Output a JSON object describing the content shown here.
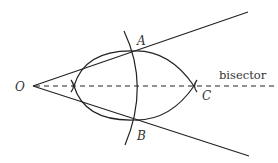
{
  "diagram": {
    "labels": {
      "vertex": "O",
      "point_a": "A",
      "point_b": "B",
      "point_c": "C",
      "bisector": "bisector"
    },
    "colors": {
      "stroke": "#222222",
      "text": "#333333",
      "background": "#ffffff"
    }
  }
}
